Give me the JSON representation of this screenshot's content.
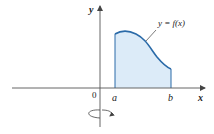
{
  "figure": {
    "axes": {
      "x_label": "x",
      "y_label": "y",
      "origin_label": "0"
    },
    "interval": {
      "a_label": "a",
      "b_label": "b"
    },
    "curve_label": "y = f(x)",
    "colors": {
      "curve": "#2a6aa8",
      "fill": "#dcebf8",
      "axis": "#555555"
    },
    "annotation": "rotation about y-axis"
  }
}
